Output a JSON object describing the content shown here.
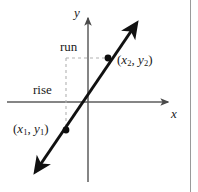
{
  "figure": {
    "background_color": "#ffffff",
    "ink_color": "#1a1a1a",
    "guide_color": "#b0b0b0",
    "axis_color": "#6b6b6b",
    "border_color": "#9a9a9a"
  },
  "axes": {
    "x_label": "x",
    "y_label": "y",
    "origin": {
      "x": 88,
      "y": 102
    },
    "x_axis": {
      "start_x": 7,
      "end_x": 168,
      "y": 102,
      "arrow": "right"
    },
    "y_axis": {
      "x": 88,
      "start_y": 182,
      "end_y": 16,
      "arrow": "up"
    }
  },
  "line": {
    "description": "straight line with arrowheads at both ends, positive slope",
    "start": {
      "x": 33,
      "y": 175
    },
    "end": {
      "x": 139,
      "y": 20
    },
    "arrows": "both"
  },
  "points": [
    {
      "name": "point-1",
      "label_open": "(",
      "label_x_var": "x",
      "label_x_sub": "1",
      "label_sep": ", ",
      "label_y_var": "y",
      "label_y_sub": "1",
      "label_close": ")",
      "cx": 66,
      "cy": 130
    },
    {
      "name": "point-2",
      "label_open": "(",
      "label_x_var": "x",
      "label_x_sub": "2",
      "label_sep": ", ",
      "label_y_var": "y",
      "label_y_sub": "2",
      "label_close": ")",
      "cx": 108,
      "cy": 58
    }
  ],
  "guides": {
    "rise_label": "rise",
    "run_label": "run",
    "vertical_dashed": {
      "x": 66,
      "y_top": 58,
      "y_bottom": 130
    },
    "horizontal_dashed": {
      "y": 58,
      "x_left": 66,
      "x_right": 108
    },
    "dash_pattern": "3,3"
  }
}
